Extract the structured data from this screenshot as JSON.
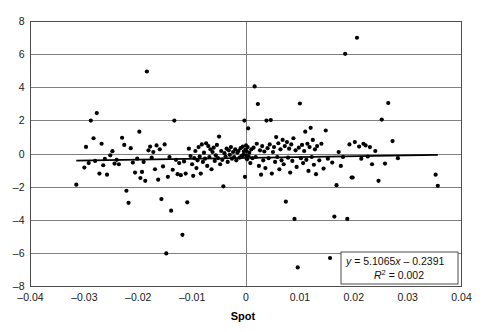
{
  "chart_data": {
    "type": "scatter",
    "title": "",
    "xlabel": "Spot",
    "ylabel": "",
    "xlim": [
      -0.04,
      0.04
    ],
    "ylim": [
      -8,
      8
    ],
    "xticks": [
      -0.04,
      -0.03,
      -0.02,
      -0.01,
      0,
      0.01,
      0.02,
      0.03,
      0.04
    ],
    "xtick_labels": [
      "–0.04",
      "–0.03",
      "–0.02",
      "–0.01",
      "0",
      "0.01",
      "0.02",
      "0.03",
      "0.04"
    ],
    "yticks": [
      -8,
      -6,
      -4,
      -2,
      0,
      2,
      4,
      6,
      8
    ],
    "ytick_labels": [
      "–8",
      "–6",
      "–4",
      "–2",
      "0",
      "2",
      "4",
      "6",
      "8"
    ],
    "grid": "horizontal",
    "legend": "none",
    "marker": {
      "shape": "circle",
      "color": "#000000",
      "size": 2.1
    },
    "trendline": {
      "type": "linear",
      "slope": 5.1065,
      "intercept": -0.2391,
      "r_squared": 0.002,
      "color": "#000000",
      "equation_text": "y = 5.1065x – 0.2391",
      "r2_text": "R",
      "r2_exponent": "2",
      "r2_value": " = 0.002"
    },
    "axis_zero_vline": 0,
    "points": [
      [
        -0.0315,
        -1.85
      ],
      [
        -0.03,
        -0.82
      ],
      [
        -0.0297,
        0.43
      ],
      [
        -0.0292,
        -0.55
      ],
      [
        -0.0288,
        2.02
      ],
      [
        -0.0283,
        0.95
      ],
      [
        -0.028,
        -0.42
      ],
      [
        -0.0277,
        2.47
      ],
      [
        -0.0272,
        -1.18
      ],
      [
        -0.0268,
        0.62
      ],
      [
        -0.0265,
        -0.68
      ],
      [
        -0.0262,
        -0.3
      ],
      [
        -0.0258,
        -1.25
      ],
      [
        -0.0252,
        -0.08
      ],
      [
        -0.0248,
        0.17
      ],
      [
        -0.0244,
        -0.58
      ],
      [
        -0.024,
        -0.35
      ],
      [
        -0.0236,
        -0.62
      ],
      [
        -0.023,
        0.98
      ],
      [
        -0.0226,
        0.55
      ],
      [
        -0.0222,
        -2.22
      ],
      [
        -0.0218,
        -2.95
      ],
      [
        -0.0214,
        0.35
      ],
      [
        -0.021,
        -0.52
      ],
      [
        -0.0206,
        -1.12
      ],
      [
        -0.0202,
        -0.28
      ],
      [
        -0.0198,
        1.35
      ],
      [
        -0.0196,
        -1.45
      ],
      [
        -0.0193,
        -1.08
      ],
      [
        -0.019,
        -0.48
      ],
      [
        -0.0187,
        -1.62
      ],
      [
        -0.0184,
        4.98
      ],
      [
        -0.0181,
        0.22
      ],
      [
        -0.0178,
        0.45
      ],
      [
        -0.0175,
        -0.22
      ],
      [
        -0.0172,
        0.12
      ],
      [
        -0.0169,
        -0.92
      ],
      [
        -0.0166,
        0.52
      ],
      [
        -0.0163,
        -1.55
      ],
      [
        -0.016,
        0.28
      ],
      [
        -0.0157,
        -2.72
      ],
      [
        -0.0154,
        -0.75
      ],
      [
        -0.0151,
        0.58
      ],
      [
        -0.0148,
        -6.0
      ],
      [
        -0.0145,
        -1.38
      ],
      [
        -0.0142,
        -0.18
      ],
      [
        -0.0139,
        -3.42
      ],
      [
        -0.0136,
        -0.95
      ],
      [
        -0.0133,
        2.02
      ],
      [
        -0.013,
        -0.35
      ],
      [
        -0.0127,
        -1.22
      ],
      [
        -0.0124,
        -0.55
      ],
      [
        -0.0121,
        -1.28
      ],
      [
        -0.0118,
        -4.88
      ],
      [
        -0.0115,
        -0.45
      ],
      [
        -0.0112,
        -1.18
      ],
      [
        -0.0109,
        -2.92
      ],
      [
        -0.0106,
        0.32
      ],
      [
        -0.0103,
        -0.12
      ],
      [
        -0.01,
        -0.62
      ],
      [
        -0.0098,
        -1.32
      ],
      [
        -0.0096,
        -0.25
      ],
      [
        -0.0094,
        0.18
      ],
      [
        -0.0092,
        -0.85
      ],
      [
        -0.009,
        -0.38
      ],
      [
        -0.0088,
        0.42
      ],
      [
        -0.0086,
        -0.15
      ],
      [
        -0.0084,
        -1.18
      ],
      [
        -0.0082,
        0.58
      ],
      [
        -0.008,
        -0.48
      ],
      [
        -0.0078,
        0.08
      ],
      [
        -0.0076,
        -0.28
      ],
      [
        -0.0074,
        0.65
      ],
      [
        -0.0072,
        -0.72
      ],
      [
        -0.007,
        0.48
      ],
      [
        -0.0068,
        -0.18
      ],
      [
        -0.0066,
        0.28
      ],
      [
        -0.0064,
        -0.92
      ],
      [
        -0.0062,
        0.12
      ],
      [
        -0.006,
        0.38
      ],
      [
        -0.0058,
        -0.42
      ],
      [
        -0.0056,
        -0.08
      ],
      [
        -0.0054,
        0.55
      ],
      [
        -0.0052,
        -0.25
      ],
      [
        -0.005,
        1.05
      ],
      [
        -0.0048,
        -0.62
      ],
      [
        -0.0046,
        0.18
      ],
      [
        -0.0044,
        -0.35
      ],
      [
        -0.0042,
        -1.95
      ],
      [
        -0.004,
        0.05
      ],
      [
        -0.0038,
        -0.15
      ],
      [
        -0.0036,
        0.32
      ],
      [
        -0.0034,
        -0.48
      ],
      [
        -0.0032,
        0.22
      ],
      [
        -0.003,
        -0.05
      ],
      [
        -0.0028,
        0.42
      ],
      [
        -0.0026,
        -0.28
      ],
      [
        -0.0024,
        0.12
      ],
      [
        -0.0022,
        -0.18
      ],
      [
        -0.002,
        0.28
      ],
      [
        -0.0018,
        -0.38
      ],
      [
        -0.0016,
        0.08
      ],
      [
        -0.0014,
        0.18
      ],
      [
        -0.0012,
        -0.22
      ],
      [
        -0.001,
        0.35
      ],
      [
        -0.0008,
        -0.12
      ],
      [
        -0.0006,
        0.45
      ],
      [
        -0.0005,
        -0.05
      ],
      [
        -0.0004,
        0.15
      ],
      [
        -0.0003,
        2.02
      ],
      [
        -0.0002,
        -1.38
      ],
      [
        -0.0001,
        0.25
      ],
      [
        0.0,
        -0.08
      ],
      [
        0.0,
        0.52
      ],
      [
        0.0001,
        0.18
      ],
      [
        0.0002,
        -0.32
      ],
      [
        0.0003,
        0.42
      ],
      [
        0.0004,
        1.55
      ],
      [
        0.0005,
        -0.15
      ],
      [
        0.0006,
        0.08
      ],
      [
        0.0008,
        -0.55
      ],
      [
        0.001,
        0.28
      ],
      [
        0.0012,
        -0.25
      ],
      [
        0.0014,
        0.38
      ],
      [
        0.0016,
        4.08
      ],
      [
        0.0018,
        -0.18
      ],
      [
        0.002,
        0.62
      ],
      [
        0.0022,
        3.02
      ],
      [
        0.0024,
        -0.72
      ],
      [
        0.0026,
        0.22
      ],
      [
        0.0028,
        -1.25
      ],
      [
        0.003,
        0.48
      ],
      [
        0.0032,
        -0.38
      ],
      [
        0.0034,
        0.15
      ],
      [
        0.0036,
        -0.85
      ],
      [
        0.0038,
        2.02
      ],
      [
        0.004,
        0.35
      ],
      [
        0.0042,
        -0.25
      ],
      [
        0.0044,
        0.58
      ],
      [
        0.0046,
        2.05
      ],
      [
        0.0048,
        -1.18
      ],
      [
        0.005,
        0.12
      ],
      [
        0.0052,
        0.42
      ],
      [
        0.0054,
        -0.48
      ],
      [
        0.0056,
        1.02
      ],
      [
        0.0058,
        -0.18
      ],
      [
        0.006,
        0.65
      ],
      [
        0.0062,
        -0.92
      ],
      [
        0.0064,
        0.28
      ],
      [
        0.0066,
        -0.38
      ],
      [
        0.0068,
        0.85
      ],
      [
        0.007,
        -0.62
      ],
      [
        0.0072,
        0.48
      ],
      [
        0.0074,
        -2.88
      ],
      [
        0.0076,
        0.72
      ],
      [
        0.0078,
        -0.22
      ],
      [
        0.008,
        0.32
      ],
      [
        0.0082,
        -1.12
      ],
      [
        0.0084,
        0.58
      ],
      [
        0.0086,
        -0.42
      ],
      [
        0.0088,
        0.95
      ],
      [
        0.009,
        -3.92
      ],
      [
        0.0092,
        0.22
      ],
      [
        0.0094,
        -0.78
      ],
      [
        0.0096,
        -6.85
      ],
      [
        0.0098,
        0.38
      ],
      [
        0.01,
        3.05
      ],
      [
        0.0102,
        -0.25
      ],
      [
        0.0104,
        0.55
      ],
      [
        0.0106,
        -0.55
      ],
      [
        0.0108,
        0.18
      ],
      [
        0.011,
        1.35
      ],
      [
        0.0112,
        -0.35
      ],
      [
        0.0114,
        0.62
      ],
      [
        0.0116,
        -1.02
      ],
      [
        0.0118,
        0.42
      ],
      [
        0.012,
        1.58
      ],
      [
        0.0122,
        -0.18
      ],
      [
        0.0124,
        0.85
      ],
      [
        0.0126,
        -0.65
      ],
      [
        0.0128,
        0.28
      ],
      [
        0.013,
        -1.22
      ],
      [
        0.0132,
        0.48
      ],
      [
        0.0136,
        -0.38
      ],
      [
        0.014,
        0.62
      ],
      [
        0.0144,
        -0.88
      ],
      [
        0.0148,
        1.42
      ],
      [
        0.0152,
        -0.28
      ],
      [
        0.0156,
        -6.28
      ],
      [
        0.016,
        -0.52
      ],
      [
        0.0164,
        -3.78
      ],
      [
        0.0168,
        -1.88
      ],
      [
        0.0172,
        0.12
      ],
      [
        0.0176,
        -0.72
      ],
      [
        0.018,
        -0.18
      ],
      [
        0.0184,
        6.05
      ],
      [
        0.0188,
        -3.92
      ],
      [
        0.0192,
        0.58
      ],
      [
        0.0196,
        -1.42
      ],
      [
        0.0198,
        -1.42
      ],
      [
        0.0202,
        0.72
      ],
      [
        0.0206,
        7.02
      ],
      [
        0.021,
        0.45
      ],
      [
        0.0214,
        -0.28
      ],
      [
        0.0218,
        0.62
      ],
      [
        0.0222,
        0.52
      ],
      [
        0.0226,
        -0.15
      ],
      [
        0.023,
        0.42
      ],
      [
        0.0234,
        -0.62
      ],
      [
        0.024,
        0.18
      ],
      [
        0.0246,
        -1.62
      ],
      [
        0.0252,
        2.08
      ],
      [
        0.0258,
        -0.58
      ],
      [
        0.0264,
        3.08
      ],
      [
        0.0272,
        0.78
      ],
      [
        0.0282,
        -0.25
      ],
      [
        0.0352,
        -1.25
      ],
      [
        0.0356,
        -1.92
      ]
    ]
  },
  "figure": {
    "background": "#ffffff",
    "plot_border_color": "#4d4d4d",
    "gridline_color": "#808080",
    "text_color": "#1a1a1a"
  }
}
